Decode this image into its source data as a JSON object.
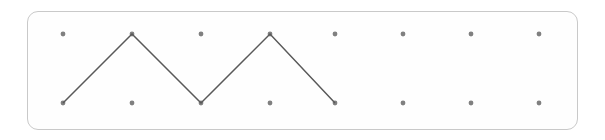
{
  "board": {
    "name": "geoboard",
    "width": 605,
    "height": 140,
    "background_color": "#ffffff",
    "frame": {
      "x": 27,
      "y": 11,
      "width": 551,
      "height": 119,
      "corner_radius": 11,
      "border_color": "#c9c9c9",
      "border_width": 1.5,
      "fill_color": "#fefefe"
    },
    "grid": {
      "rows": 2,
      "columns": 8,
      "row_y": [
        34,
        103
      ],
      "column_x": [
        63,
        132,
        201,
        270,
        335,
        403,
        471,
        539
      ],
      "dot_radius": 2.4,
      "dot_color": "#808080"
    },
    "shape": {
      "type": "polyline",
      "stroke_color": "#595959",
      "stroke_width": 1.5,
      "closed": false,
      "vertices": [
        {
          "x": 63,
          "y": 103,
          "row": 1,
          "column": 0
        },
        {
          "x": 132,
          "y": 34,
          "row": 0,
          "column": 1
        },
        {
          "x": 201,
          "y": 103,
          "row": 1,
          "column": 2
        },
        {
          "x": 270,
          "y": 34,
          "row": 0,
          "column": 3
        },
        {
          "x": 335,
          "y": 103,
          "row": 1,
          "column": 4
        }
      ]
    }
  }
}
